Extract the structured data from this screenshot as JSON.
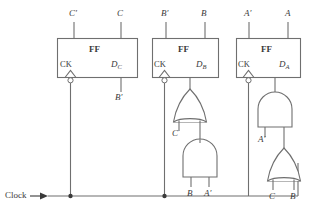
{
  "diagram": {
    "stroke_color": "#6f6f6f",
    "text_color": "#3a3a3a",
    "clock": {
      "label": "Clock",
      "arrow_icon": "right-arrow-icon"
    },
    "flipflops": [
      {
        "id": "ff-c",
        "name": "FF",
        "clock_pin_label": "CK",
        "data_pin_label": "D",
        "data_pin_sub": "C",
        "out_q_prime": "C′",
        "out_q": "C",
        "input_signal": "B′",
        "clock_inverted": true
      },
      {
        "id": "ff-b",
        "name": "FF",
        "clock_pin_label": "CK",
        "data_pin_label": "D",
        "data_pin_sub": "B",
        "out_q_prime": "B′",
        "out_q": "B",
        "clock_inverted": true
      },
      {
        "id": "ff-a",
        "name": "FF",
        "clock_pin_label": "CK",
        "data_pin_label": "D",
        "data_pin_sub": "A",
        "out_q_prime": "A′",
        "out_q": "A",
        "clock_inverted": true
      }
    ],
    "gates": [
      {
        "id": "or-gate-b",
        "type": "or",
        "orientation": "up",
        "inputs": [
          "C",
          "and-gate-b"
        ],
        "input_labels": [
          "C"
        ],
        "output_to": "ff-b.D"
      },
      {
        "id": "and-gate-b",
        "type": "and",
        "orientation": "up",
        "inputs": [
          "B",
          "A′"
        ],
        "input_labels": [
          "B",
          "A′"
        ],
        "output_to": "or-gate-b"
      },
      {
        "id": "and-gate-a",
        "type": "and",
        "orientation": "up",
        "inputs": [
          "A′",
          "or-gate-a"
        ],
        "input_labels": [
          "A′"
        ],
        "output_to": "ff-a.D"
      },
      {
        "id": "or-gate-a",
        "type": "or",
        "orientation": "up",
        "inputs": [
          "C",
          "B"
        ],
        "input_labels": [
          "C",
          "B"
        ],
        "output_to": "and-gate-a"
      }
    ]
  }
}
